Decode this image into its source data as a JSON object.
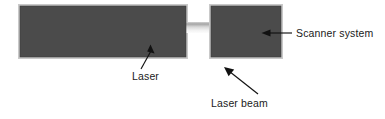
{
  "figure": {
    "background_color": "#ffffff"
  },
  "components": [
    {
      "id": "laser",
      "name": "Laser",
      "shape": "rectangle",
      "fill_color": "#4b4b4b",
      "x": 20,
      "y": 6,
      "width": 166,
      "height": 51
    },
    {
      "id": "scanner-system",
      "name": "Scanner system",
      "shape": "rectangle",
      "fill_color": "#4b4b4b",
      "x": 211,
      "y": 6,
      "width": 70,
      "height": 51
    }
  ],
  "beam": {
    "id": "laser-beam",
    "name": "Laser beam",
    "color_light": "#f4f4f4",
    "color_dark": "#9e9e9e",
    "x": 186,
    "y": 22,
    "width": 25,
    "height": 11
  },
  "annotations": [
    {
      "id": "laser-label",
      "text": "Laser",
      "text_x": 132,
      "text_y": 80,
      "anchor": "start",
      "leader_from_x": 141,
      "leader_from_y": 69,
      "leader_to_x": 152,
      "leader_to_y": 48,
      "arrow_direction": "up-left"
    },
    {
      "id": "scanner-system-label",
      "text": "Scanner system",
      "text_x": 296,
      "text_y": 37,
      "anchor": "start",
      "leader_from_x": 292,
      "leader_from_y": 33,
      "leader_to_x": 263,
      "leader_to_y": 33,
      "arrow_direction": "left"
    },
    {
      "id": "laser-beam-label",
      "text": "Laser beam",
      "text_x": 211,
      "text_y": 107,
      "anchor": "start",
      "leader_from_x": 258,
      "leader_from_y": 94,
      "leader_to_x": 225,
      "leader_to_y": 68,
      "arrow_direction": "up-left"
    }
  ]
}
